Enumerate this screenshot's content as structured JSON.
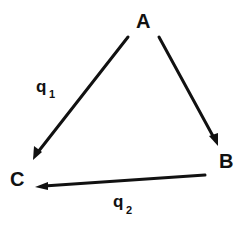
{
  "diagram": {
    "type": "directed-graph",
    "nodes": [
      {
        "id": "A",
        "label": "A"
      },
      {
        "id": "B",
        "label": "B"
      },
      {
        "id": "C",
        "label": "C"
      }
    ],
    "edges": [
      {
        "from": "A",
        "to": "C",
        "label": "q",
        "subscript": "1"
      },
      {
        "from": "A",
        "to": "B",
        "label": "",
        "subscript": ""
      },
      {
        "from": "B",
        "to": "C",
        "label": "q",
        "subscript": "2"
      }
    ],
    "colors": {
      "ink": "#111111",
      "background": "#ffffff"
    }
  }
}
